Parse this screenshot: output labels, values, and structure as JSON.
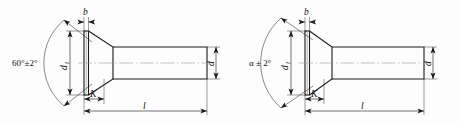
{
  "drawing": {
    "title": "Countersunk head fastener dimensional drawings",
    "figures": [
      {
        "id": "figure-left",
        "name": "countersunk-rivet-60deg",
        "labels": {
          "angle": "60°±2°",
          "head_diameter": "d",
          "head_diameter_sub": "1",
          "head_thickness": "b",
          "head_height": "K",
          "shank_diameter": "d",
          "length": "l"
        }
      },
      {
        "id": "figure-right",
        "name": "countersunk-rivet-alpha",
        "labels": {
          "angle": "α ± 2°",
          "head_diameter": "d",
          "head_diameter_sub": "1",
          "head_thickness": "b",
          "head_height": "K",
          "shank_diameter": "d",
          "length": "l"
        }
      }
    ],
    "colors": {
      "outline": "#1a1a1a",
      "thin_line": "#4a4a4a",
      "center_line": "#8a8a8a",
      "background": "#fdfdfd"
    }
  }
}
